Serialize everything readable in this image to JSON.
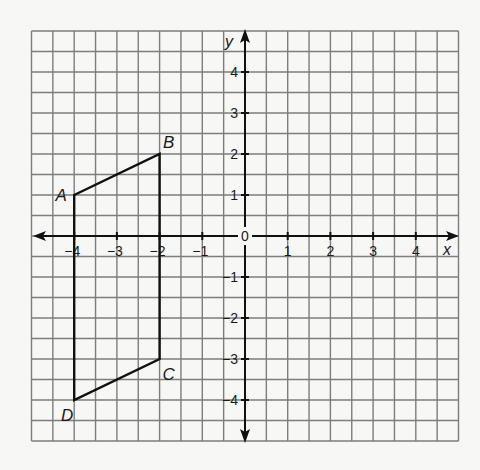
{
  "diagram": {
    "type": "coordinate-grid",
    "title": "",
    "grid": {
      "x_min": -5,
      "x_max": 5,
      "y_min": -5,
      "y_max": 5,
      "cell_units": 0.5,
      "line_color": "#7d7d7d",
      "background": "#f7f7f5"
    },
    "axes": {
      "x_label": "x",
      "y_label": "y",
      "origin_label": "0",
      "x_ticks": [
        {
          "value": -4,
          "label": "−4"
        },
        {
          "value": -3,
          "label": "−3"
        },
        {
          "value": -2,
          "label": "−2"
        },
        {
          "value": -1,
          "label": "−1"
        },
        {
          "value": 1,
          "label": "1"
        },
        {
          "value": 2,
          "label": "2"
        },
        {
          "value": 3,
          "label": "3"
        },
        {
          "value": 4,
          "label": "4"
        }
      ],
      "y_ticks": [
        {
          "value": 4,
          "label": "4"
        },
        {
          "value": 3,
          "label": "3"
        },
        {
          "value": 2,
          "label": "2"
        },
        {
          "value": 1,
          "label": "1"
        },
        {
          "value": -1,
          "label": "−1"
        },
        {
          "value": -2,
          "label": "−2"
        },
        {
          "value": -3,
          "label": "−3"
        },
        {
          "value": -4,
          "label": "−4"
        }
      ],
      "color": "#111111"
    },
    "shape": {
      "name": "quadrilateral ABCD",
      "stroke": "#111111",
      "vertices": [
        {
          "label": "A",
          "x": -4,
          "y": 1
        },
        {
          "label": "B",
          "x": -2,
          "y": 2
        },
        {
          "label": "C",
          "x": -2,
          "y": -3
        },
        {
          "label": "D",
          "x": -4,
          "y": -4
        }
      ]
    }
  }
}
